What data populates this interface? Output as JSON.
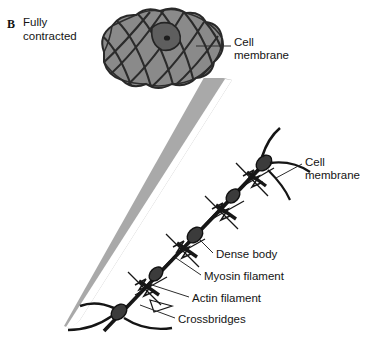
{
  "figure": {
    "panel_letter": "B",
    "caption_line_1": "Fully",
    "caption_line_2": "contracted",
    "background_color": "#ffffff",
    "colors": {
      "cell_body_gray": "#8b8b8b",
      "cell_outline": "#2a2a2a",
      "nucleus_gray": "#606060",
      "magnifier_cone_gray": "#a9a9a9",
      "filament_black": "#161616",
      "text_black": "#141414",
      "leader_line": "#2d2d2d"
    }
  },
  "labels": {
    "cell_membrane_top": "Cell\nmembrane",
    "cell_membrane_mid": "Cell\nmembrane",
    "dense_body": "Dense body",
    "myosin_filament": "Myosin filament",
    "actin_filament": "Actin filament",
    "crossbridges": "Crossbridges"
  },
  "diagram": {
    "type": "biological-illustration",
    "contracted_cell": {
      "description": "Globular, lobed contracted smooth muscle cell drawn as overlapping rounded segments with crossing dark contour lines and a single nucleus",
      "lobe_count": 14,
      "nucleus_present": true,
      "center_x": 160,
      "center_y": 50
    },
    "magnifier_cone": {
      "description": "Light gray wedge expanding from the magnified filament detail up to the contracted cell",
      "apex_x": 63,
      "apex_y": 326,
      "wide_end_y": 80
    },
    "magnified_detail": {
      "description": "Diagonal contractile apparatus running from lower-left to upper-right showing dense bodies joined by filament bundles",
      "dense_body_count": 4,
      "crossbridge_cluster_count": 4,
      "orientation_degrees": -48
    }
  }
}
